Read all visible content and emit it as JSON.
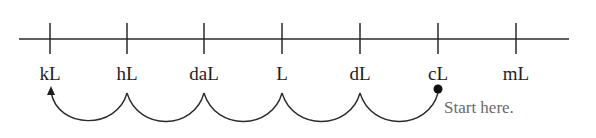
{
  "diagram": {
    "units": [
      {
        "label": "kL",
        "x": 50
      },
      {
        "label": "hL",
        "x": 127
      },
      {
        "label": "daL",
        "x": 204
      },
      {
        "label": "L",
        "x": 282
      },
      {
        "label": "dL",
        "x": 360
      },
      {
        "label": "cL",
        "x": 438
      },
      {
        "label": "mL",
        "x": 516
      }
    ],
    "start_label": "Start here.",
    "colors": {
      "line": "#2a2a2a",
      "note": "#6a6a6a"
    }
  }
}
